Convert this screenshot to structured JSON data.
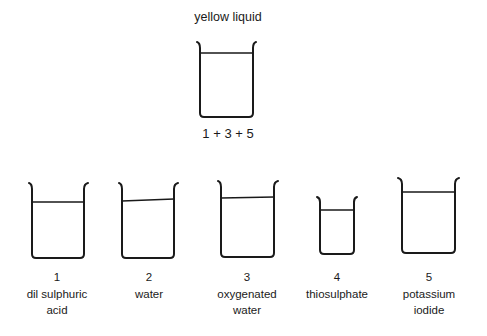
{
  "top": {
    "title": "yellow liquid",
    "label": "1 + 3 + 5"
  },
  "beakers": [
    {
      "number": "1",
      "line1": "dil sulphuric",
      "line2": "acid"
    },
    {
      "number": "2",
      "line1": "water",
      "line2": ""
    },
    {
      "number": "3",
      "line1": "oxygenated",
      "line2": "water"
    },
    {
      "number": "4",
      "line1": "thiosulphate",
      "line2": ""
    },
    {
      "number": "5",
      "line1": "potassium",
      "line2": "iodide"
    }
  ]
}
